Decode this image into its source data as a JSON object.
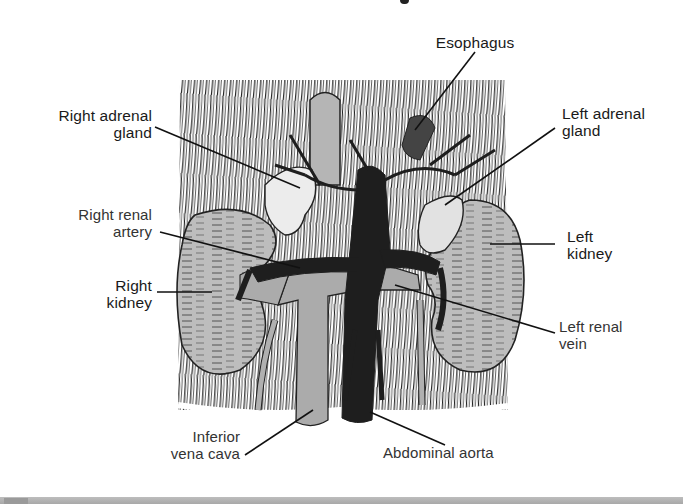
{
  "figure": {
    "labels": {
      "esophagus": [
        "Esophagus"
      ],
      "right_adrenal_gland": [
        "Right adrenal",
        "gland"
      ],
      "left_adrenal_gland": [
        "Left adrenal",
        "gland"
      ],
      "right_renal_artery": [
        "Right renal",
        "artery"
      ],
      "left_kidney": [
        "Left",
        "kidney"
      ],
      "right_kidney": [
        "Right",
        "kidney"
      ],
      "left_renal_vein": [
        "Left renal",
        "vein"
      ],
      "inferior_vena_cava": [
        "Inferior",
        "vena cava"
      ],
      "abdominal_aorta": [
        "Abdominal aorta"
      ]
    },
    "colors": {
      "background": "#ffffff",
      "ink": "#1a1a1a",
      "organ_gray": "#b9b9b9",
      "vein_gray": "#a9a9a9",
      "artery_dark": "#1e1e1e",
      "adrenal_light": "#e6e6e6",
      "bottom_bar": "#b0b0b0"
    }
  }
}
